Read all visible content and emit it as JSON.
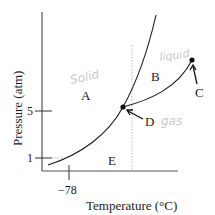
{
  "diagram": {
    "type": "phase-diagram",
    "axes": {
      "xlabel": "Temperature (°C)",
      "ylabel": "Pressure (atm)",
      "y_ticks": [
        {
          "label": "5",
          "value": 5
        },
        {
          "label": "1",
          "value": 1
        }
      ],
      "x_ticks": [
        {
          "label": "−78",
          "value": -78
        }
      ]
    },
    "regions": [
      {
        "id": "A",
        "label": "A",
        "annotation": "Solid"
      },
      {
        "id": "B",
        "label": "B",
        "annotation": "liquid"
      },
      {
        "id": "E",
        "label": "E",
        "annotation": "gas"
      }
    ],
    "points": [
      {
        "id": "C",
        "label": "C",
        "meaning": "critical point"
      },
      {
        "id": "D",
        "label": "D",
        "meaning": "triple point"
      }
    ],
    "handwritten": {
      "solid": "Solid",
      "liquid": "liquid",
      "gas": "gas"
    },
    "colors": {
      "line": "#1a1a1a",
      "axis": "#555555",
      "dotted": "#bdbdbd",
      "handwriting": "#c9c9c9"
    }
  }
}
